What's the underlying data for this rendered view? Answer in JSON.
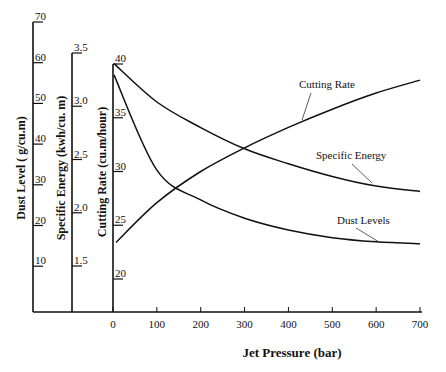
{
  "chart_data": {
    "type": "line",
    "title": "",
    "xlabel": "Jet Pressure (bar)",
    "x": [
      0,
      100,
      200,
      300,
      400,
      500,
      600,
      700
    ],
    "xlim": [
      0,
      700
    ],
    "x_ticks": [
      "0",
      "100",
      "200",
      "300",
      "400",
      "500",
      "600",
      "700"
    ],
    "grid": false,
    "legend": "inline labels with leader lines",
    "y_axes": [
      {
        "id": "dust",
        "label": "Dust Level ( g/cu.m)",
        "range": [
          0,
          70
        ],
        "ticks": [
          "10",
          "20",
          "30",
          "40",
          "50",
          "60",
          "70"
        ]
      },
      {
        "id": "energy",
        "label": "Specific Energy (kwh/cu. m)",
        "range": [
          1.0,
          3.5
        ],
        "ticks": [
          "1.5",
          "2.0",
          "2.5",
          "3.0",
          "3.5"
        ]
      },
      {
        "id": "rate",
        "label": "Cutting Rate (cu.m/hour)",
        "range": [
          17.5,
          40
        ],
        "ticks": [
          "20",
          "25",
          "30",
          "35",
          "40"
        ]
      }
    ],
    "series": [
      {
        "name": "Cutting Rate",
        "axis": "rate",
        "values": [
          23.4,
          27.1,
          30.0,
          32.2,
          34.1,
          35.8,
          37.3,
          38.5
        ]
      },
      {
        "name": "Specific Energy",
        "axis": "energy",
        "values": [
          3.4,
          3.04,
          2.8,
          2.6,
          2.46,
          2.34,
          2.25,
          2.2
        ]
      },
      {
        "name": "Dust Levels",
        "axis": "dust",
        "values": [
          57.0,
          33.6,
          26.3,
          21.8,
          18.9,
          17.0,
          16.0,
          15.5
        ]
      }
    ]
  },
  "labels": {
    "xlabel": "Jet Pressure (bar)",
    "dust_axis": "Dust Level ( g/cu.m)",
    "energy_axis": "Specific Energy (kwh/cu. m)",
    "rate_axis": "Cutting Rate (cu.m/hour)",
    "series_cutting_rate": "Cutting Rate",
    "series_specific_energy": "Specific Energy",
    "series_dust_levels": "Dust Levels"
  }
}
